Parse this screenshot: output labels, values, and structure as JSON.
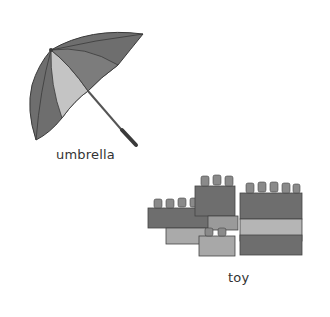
{
  "items": [
    {
      "name": "umbrella",
      "label": "umbrella"
    },
    {
      "name": "toy",
      "label": "toy"
    }
  ],
  "colors": {
    "dark_gray": "#6e6e6e",
    "mid_gray": "#8a8a8a",
    "light_gray": "#c4c4c4",
    "outline": "#3a3a3a"
  }
}
